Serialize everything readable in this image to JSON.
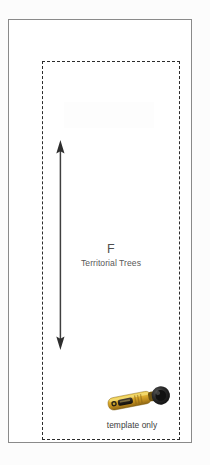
{
  "document": {
    "type": "quilting-block-template-diagram",
    "background_color": "#fcfcfc",
    "sheet_color": "#ffffff"
  },
  "frame": {
    "outer_border_color": "#8a8a8a",
    "dashed_border_color": "#2b2b2b",
    "dashed_style": "dashed"
  },
  "dimension_arrow": {
    "name": "vertical-double-headed-arrow",
    "orientation": "vertical",
    "heads": "both",
    "color": "#3a3a3a",
    "label": ""
  },
  "zone_label": {
    "letter": "F",
    "name": "Territorial Trees",
    "letter_color": "#4f4f4f",
    "name_color": "#595959"
  },
  "tool": {
    "name": "rotary-cutter",
    "body_color": "#d8a92b",
    "body_highlight": "#f0d14a",
    "accent_color": "#1d1d1d",
    "blade_hub_color": "#2a2a2a",
    "handle_dark": "#1a1a1a"
  },
  "caption": {
    "text": "template only",
    "color": "#3d3d3d"
  }
}
